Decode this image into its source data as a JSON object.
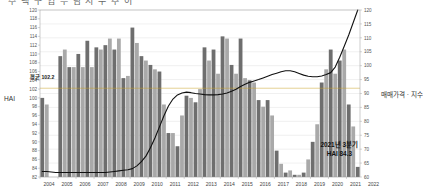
{
  "title_clipped": "주 택 구 입 부 담 지 수 추 이",
  "axis": {
    "left_label": "HAI",
    "right_label": "매매가격 · 지수",
    "left_ticks": [
      120,
      118,
      116,
      114,
      112,
      110,
      108,
      106,
      104,
      102,
      100,
      98,
      96,
      94,
      92,
      90,
      88,
      86,
      84,
      82
    ],
    "right_ticks": [
      120,
      115,
      110,
      105,
      100,
      95,
      90,
      85,
      80,
      75,
      70,
      65,
      60
    ],
    "x_ticks": [
      "2004",
      "2005",
      "2006",
      "2007",
      "2008",
      "2009",
      "2010",
      "2011",
      "2012",
      "2013",
      "2014",
      "2015",
      "2016",
      "2017",
      "2018",
      "2019",
      "2020",
      "2021",
      "2022"
    ]
  },
  "annotations": {
    "average_label": "평균 102.2",
    "average_value": 102.2,
    "callout_line1": "2021년 3분기",
    "callout_line2": "HAI 84.3"
  },
  "colors": {
    "bar_dark": "#6e6e6e",
    "bar_light": "#a9a9a9",
    "line": "#111111",
    "avg_line": "#c9a227",
    "grid": "#d9d9d9",
    "axis": "#9a9a9a",
    "text": "#444444"
  },
  "chart_data": {
    "type": "bar",
    "title": "주 택 구 입 부 담 지 수 추 이",
    "xlabel": "",
    "ylabel": "HAI",
    "ylim": [
      82,
      120
    ],
    "y2lim": [
      60,
      120
    ],
    "y2label": "매매가격 · 지수",
    "grid": true,
    "legend": "none",
    "categories": [
      "2004Q1",
      "2004Q2",
      "2004Q3",
      "2004Q4",
      "2005Q1",
      "2005Q2",
      "2005Q3",
      "2005Q4",
      "2006Q1",
      "2006Q2",
      "2006Q3",
      "2006Q4",
      "2007Q1",
      "2007Q2",
      "2007Q3",
      "2007Q4",
      "2008Q1",
      "2008Q2",
      "2008Q3",
      "2008Q4",
      "2009Q1",
      "2009Q2",
      "2009Q3",
      "2009Q4",
      "2010Q1",
      "2010Q2",
      "2010Q3",
      "2010Q4",
      "2011Q1",
      "2011Q2",
      "2011Q3",
      "2011Q4",
      "2012Q1",
      "2012Q2",
      "2012Q3",
      "2012Q4",
      "2013Q1",
      "2013Q2",
      "2013Q3",
      "2013Q4",
      "2014Q1",
      "2014Q2",
      "2014Q3",
      "2014Q4",
      "2015Q1",
      "2015Q2",
      "2015Q3",
      "2015Q4",
      "2016Q1",
      "2016Q2",
      "2016Q3",
      "2016Q4",
      "2017Q1",
      "2017Q2",
      "2017Q3",
      "2017Q4",
      "2018Q1",
      "2018Q2",
      "2018Q3",
      "2018Q4",
      "2019Q1",
      "2019Q2",
      "2019Q3",
      "2019Q4",
      "2020Q1",
      "2020Q2",
      "2020Q3",
      "2020Q4",
      "2021Q1",
      "2021Q2",
      "2021Q3"
    ],
    "series": [
      {
        "name": "HAI",
        "axis": "left",
        "type": "bar",
        "values": [
          100.0,
          98.5,
          null,
          null,
          109.5,
          111.0,
          107.0,
          107.0,
          110.0,
          107.0,
          113.0,
          107.0,
          111.5,
          111.0,
          112.0,
          113.5,
          111.0,
          113.5,
          104.5,
          105.0,
          116.0,
          112.5,
          109.5,
          108.5,
          107.5,
          106.5,
          106.0,
          98.5,
          92.0,
          92.0,
          89.0,
          96.0,
          100.5,
          100.0,
          99.0,
          102.0,
          111.5,
          108.5,
          111.0,
          105.5,
          114.0,
          113.5,
          107.5,
          105.5,
          113.5,
          104.5,
          104.0,
          103.5,
          99.5,
          98.0,
          99.5,
          96.0,
          88.0,
          85.0,
          83.0,
          83.5,
          82.5,
          82.5,
          83.0,
          86.0,
          90.0,
          94.0,
          103.5,
          106.5,
          111.0,
          105.5,
          108.5,
          111.0,
          98.5,
          93.5,
          84.3
        ]
      },
      {
        "name": "매매가격 · 지수",
        "axis": "right",
        "type": "line",
        "values": [
          62.0,
          62.0,
          61.8,
          61.6,
          61.6,
          61.6,
          61.6,
          61.6,
          61.6,
          61.6,
          61.6,
          61.6,
          61.6,
          61.6,
          61.6,
          61.8,
          62.0,
          62.2,
          62.4,
          62.6,
          63.0,
          64.0,
          65.5,
          67.5,
          70.5,
          74.0,
          78.0,
          82.0,
          85.5,
          88.0,
          89.5,
          90.2,
          90.5,
          90.3,
          90.0,
          89.8,
          89.6,
          89.5,
          89.5,
          89.6,
          89.8,
          90.2,
          90.8,
          91.5,
          92.5,
          93.3,
          94.0,
          94.5,
          95.0,
          95.6,
          96.2,
          96.8,
          97.3,
          97.8,
          98.2,
          98.2,
          97.8,
          97.2,
          96.6,
          96.2,
          96.0,
          96.0,
          96.3,
          96.8,
          97.5,
          99.5,
          103.0,
          107.0,
          111.0,
          115.5,
          120.0
        ]
      }
    ]
  }
}
